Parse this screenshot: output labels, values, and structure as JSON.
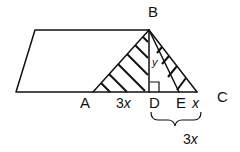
{
  "figure": {
    "points": {
      "A": "A",
      "B": "B",
      "C": "C",
      "D": "D",
      "E": "E"
    },
    "segment_labels": {
      "AD": "3",
      "AD_var": "x",
      "EC": "x",
      "DC_brace": "3",
      "DC_brace_var": "x",
      "BD_angle": "y"
    },
    "colors": {
      "stroke": "#111111",
      "background": "#ffffff"
    }
  }
}
